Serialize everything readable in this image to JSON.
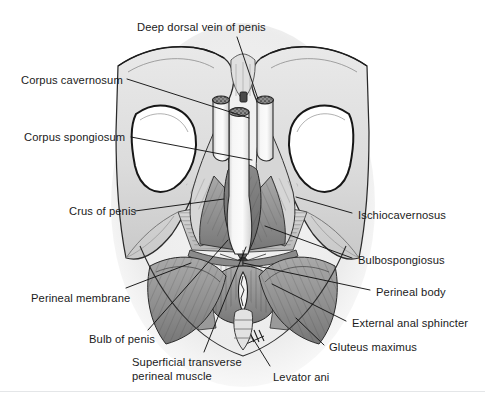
{
  "figure": {
    "width": 485,
    "height": 402,
    "background_color": "#ffffff",
    "ink_color": "#1b1b1b",
    "panel_tint": "#ededed"
  },
  "labels": [
    {
      "id": "deep-dorsal-vein",
      "text": "Deep dorsal vein of penis",
      "x": 137,
      "y": 21,
      "align": "left",
      "lines": [
        "Deep dorsal vein of penis"
      ]
    },
    {
      "id": "corpus-cavernosum",
      "text": "Corpus cavernosum",
      "x": 21,
      "y": 74,
      "align": "left",
      "lines": [
        "Corpus cavernosum"
      ]
    },
    {
      "id": "corpus-spongiosum",
      "text": "Corpus spongiosum",
      "x": 24,
      "y": 131,
      "align": "left",
      "lines": [
        "Corpus spongiosum"
      ]
    },
    {
      "id": "crus-of-penis",
      "text": "Crus of penis",
      "x": 69,
      "y": 205,
      "align": "left",
      "lines": [
        "Crus of penis"
      ]
    },
    {
      "id": "perineal-membrane",
      "text": "Perineal membrane",
      "x": 31,
      "y": 292,
      "align": "left",
      "lines": [
        "Perineal membrane"
      ]
    },
    {
      "id": "bulb-of-penis",
      "text": "Bulb of penis",
      "x": 89,
      "y": 333,
      "align": "left",
      "lines": [
        "Bulb of penis"
      ]
    },
    {
      "id": "superficial-transverse",
      "text": "Superficial transverse perineal muscle",
      "x": 132,
      "y": 356,
      "align": "left",
      "lines": [
        "Superficial transverse",
        "perineal muscle"
      ]
    },
    {
      "id": "levator-ani",
      "text": "Levator ani",
      "x": 273,
      "y": 371,
      "align": "left",
      "lines": [
        "Levator ani"
      ]
    },
    {
      "id": "ischiocavernosus",
      "text": "Ischiocavernosus",
      "x": 358,
      "y": 209,
      "align": "left",
      "lines": [
        "Ischiocavernosus"
      ]
    },
    {
      "id": "bulbospongiosus",
      "text": "Bulbospongiosus",
      "x": 358,
      "y": 254,
      "align": "left",
      "lines": [
        "Bulbospongiosus"
      ]
    },
    {
      "id": "perineal-body",
      "text": "Perineal body",
      "x": 376,
      "y": 286,
      "align": "left",
      "lines": [
        "Perineal body"
      ]
    },
    {
      "id": "external-anal-sphincter",
      "text": "External anal sphincter",
      "x": 352,
      "y": 317,
      "align": "left",
      "lines": [
        "External anal sphincter"
      ]
    },
    {
      "id": "gluteus-maximus",
      "text": "Gluteus maximus",
      "x": 329,
      "y": 341,
      "align": "left",
      "lines": [
        "Gluteus maximus"
      ]
    }
  ],
  "leaders": [
    {
      "id": "leader-deep-dorsal-vein",
      "from": [
        237,
        37
      ],
      "to": [
        258,
        99
      ]
    },
    {
      "id": "leader-corpus-cavernosum",
      "from": [
        127,
        79
      ],
      "to": [
        249,
        118
      ]
    },
    {
      "id": "leader-corpus-spongiosum",
      "from": [
        131,
        137
      ],
      "to": [
        252,
        160
      ]
    },
    {
      "id": "leader-crus-of-penis",
      "from": [
        135,
        211
      ],
      "to": [
        224,
        199
      ]
    },
    {
      "id": "leader-perineal-membrane",
      "from": [
        126,
        288
      ],
      "to": [
        191,
        263
      ]
    },
    {
      "id": "leader-bulb-of-penis",
      "from": [
        148,
        330
      ],
      "to": [
        228,
        240
      ]
    },
    {
      "id": "leader-superficial-transverse",
      "from": [
        204,
        352
      ],
      "to": [
        246,
        247
      ]
    },
    {
      "id": "leader-levator-ani",
      "from": [
        270,
        366
      ],
      "to": [
        252,
        337
      ]
    },
    {
      "id": "leader-ischiocavernosus",
      "from": [
        352,
        213
      ],
      "to": [
        296,
        197
      ]
    },
    {
      "id": "leader-bulbospongiosus",
      "from": [
        352,
        258
      ],
      "to": [
        265,
        226
      ]
    },
    {
      "id": "leader-perineal-body",
      "from": [
        370,
        290
      ],
      "to": [
        243,
        263
      ]
    },
    {
      "id": "leader-external-anal-sphincter",
      "from": [
        346,
        321
      ],
      "to": [
        272,
        284
      ]
    },
    {
      "id": "leader-gluteus-maximus",
      "from": [
        324,
        345
      ],
      "to": [
        296,
        318
      ]
    }
  ],
  "structures": [
    {
      "id": "pubic-bone-left",
      "name": "left pubic bone / ischiopubic ramus"
    },
    {
      "id": "pubic-bone-right",
      "name": "right pubic bone / ischiopubic ramus"
    },
    {
      "id": "obturator-foramen-left",
      "name": "left obturator foramen"
    },
    {
      "id": "obturator-foramen-right",
      "name": "right obturator foramen"
    },
    {
      "id": "corpora-cavernosa-cut",
      "name": "cut ends of corpora cavernosa"
    },
    {
      "id": "corpus-spongiosum-shaft",
      "name": "corpus spongiosum shaft"
    },
    {
      "id": "ischiocavernosus-muscle-left",
      "name": "left ischiocavernosus muscle"
    },
    {
      "id": "ischiocavernosus-muscle-right",
      "name": "right ischiocavernosus muscle"
    },
    {
      "id": "bulbospongiosus-muscle",
      "name": "bulbospongiosus muscle"
    },
    {
      "id": "perineal-membrane-sheet",
      "name": "perineal membrane"
    },
    {
      "id": "perineal-body-node",
      "name": "perineal body (central tendon)"
    },
    {
      "id": "external-anal-sphincter-ring",
      "name": "external anal sphincter"
    },
    {
      "id": "anal-canal-opening",
      "name": "anus"
    },
    {
      "id": "gluteus-maximus-left",
      "name": "left gluteus maximus"
    },
    {
      "id": "gluteus-maximus-right",
      "name": "right gluteus maximus"
    },
    {
      "id": "coccyx",
      "name": "coccyx"
    },
    {
      "id": "levator-ani-muscle",
      "name": "levator ani"
    }
  ]
}
